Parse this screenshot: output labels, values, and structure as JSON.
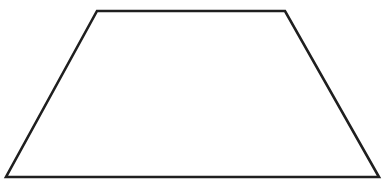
{
  "figure": {
    "shape": "trapezoid",
    "background": "#ffffff",
    "stroke_color": "#1f1f1f",
    "stroke_width": 2.6,
    "fill": "none",
    "vertices": [
      {
        "name": "top-left",
        "x": 97,
        "y": 11
      },
      {
        "name": "top-right",
        "x": 285,
        "y": 11
      },
      {
        "name": "bottom-right",
        "x": 379,
        "y": 177
      },
      {
        "name": "bottom-left",
        "x": 6,
        "y": 177
      }
    ]
  }
}
